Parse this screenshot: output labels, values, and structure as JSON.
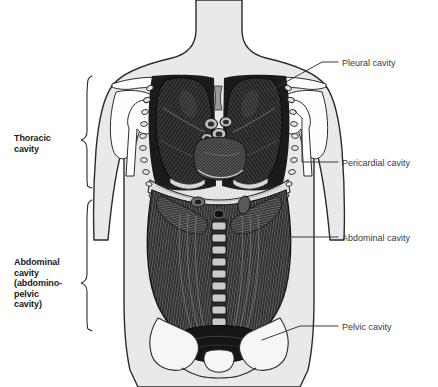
{
  "figure": {
    "background_color": "#ffffff",
    "body_fill": "#e9e9e9",
    "bone_fill": "#fdfdfd",
    "outline_color": "#2b2b2b",
    "organ_dark": "#1d1d1d",
    "organ_mid": "#4a4a4a",
    "leader_color": "#3a3a3a"
  },
  "brace_labels": [
    {
      "id": "thoracic",
      "text": "Thoracic\ncavity",
      "lines": [
        "Thoracic",
        "cavity"
      ]
    },
    {
      "id": "abdominal",
      "text": "Abdominal\ncavity\n(abdomino-\npelvic\ncavity)",
      "lines": [
        "Abdominal",
        "cavity",
        "(abdomino-",
        "pelvic",
        "cavity)"
      ]
    }
  ],
  "callout_labels": [
    {
      "id": "pleural",
      "text": "Pleural cavity"
    },
    {
      "id": "pericardial",
      "text": "Pericardial cavity"
    },
    {
      "id": "abdominal_cavity",
      "text": "Abdominal cavity"
    },
    {
      "id": "pelvic",
      "text": "Pelvic cavity"
    }
  ],
  "anatomy_parts": [
    "neck",
    "shoulders",
    "clavicle",
    "scapula",
    "humerus",
    "ribs",
    "left-lung",
    "right-lung",
    "heart",
    "great-vessels",
    "diaphragm",
    "abdominal-viscera",
    "vertebral-column",
    "pelvis",
    "sacrum"
  ]
}
